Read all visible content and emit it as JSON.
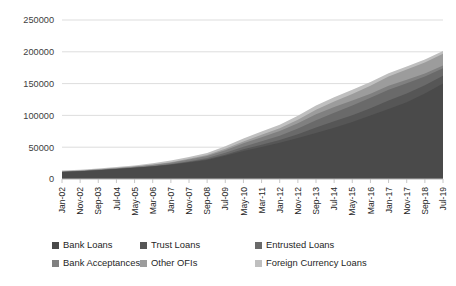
{
  "chart_data": {
    "type": "area",
    "stacked": true,
    "title": "",
    "subtitle": "",
    "xlabel": "",
    "ylabel": "",
    "ylim": [
      0,
      250000
    ],
    "yticks": [
      0,
      50000,
      100000,
      150000,
      200000,
      250000
    ],
    "ytick_labels": [
      "0",
      "50000",
      "100000",
      "150000",
      "200000",
      "250000"
    ],
    "grid": true,
    "grid_axis": "y",
    "legend_position": "bottom",
    "legend_columns": 3,
    "x": [
      "Jan-02",
      "Nov-02",
      "Sep-03",
      "Jul-04",
      "May-05",
      "Mar-06",
      "Jan-07",
      "Nov-07",
      "Sep-08",
      "Jul-09",
      "May-10",
      "Mar-11",
      "Jan-12",
      "Nov-12",
      "Sep-13",
      "Jul-14",
      "May-15",
      "Mar-16",
      "Jan-17",
      "Nov-17",
      "Sep-18",
      "Jul-19"
    ],
    "xtick_labels": [
      "Jan-02",
      "Nov-02",
      "Sep-03",
      "Jul-04",
      "May-05",
      "Mar-06",
      "Jan-07",
      "Nov-07",
      "Sep-08",
      "Jul-09",
      "May-10",
      "Mar-11",
      "Jan-12",
      "Nov-12",
      "Sep-13",
      "Jul-14",
      "May-15",
      "Mar-16",
      "Jan-17",
      "Nov-17",
      "Sep-18",
      "Jul-19"
    ],
    "series": [
      {
        "name": "Bank Loans",
        "color": "#4a4a4a",
        "values": [
          11000,
          12200,
          13800,
          15600,
          17500,
          19800,
          22500,
          26000,
          30000,
          36500,
          44000,
          50500,
          57000,
          64500,
          72500,
          80500,
          89500,
          100000,
          110000,
          120500,
          134500,
          150000
        ]
      },
      {
        "name": "Trust Loans",
        "color": "#565656",
        "values": [
          0,
          0,
          0,
          0,
          0,
          100,
          300,
          700,
          1100,
          1800,
          2600,
          3400,
          4200,
          6000,
          8400,
          10200,
          10800,
          11200,
          13500,
          14000,
          13000,
          12200
        ]
      },
      {
        "name": "Entrusted Loans",
        "color": "#6a6a6a",
        "values": [
          0,
          0,
          0,
          0,
          100,
          300,
          600,
          1100,
          1800,
          2800,
          4100,
          5400,
          6900,
          8800,
          11400,
          13500,
          15200,
          16500,
          17000,
          16000,
          13500,
          12000
        ]
      },
      {
        "name": "Bank Acceptances",
        "color": "#808080",
        "values": [
          800,
          900,
          1100,
          1300,
          1500,
          1800,
          2200,
          2800,
          3200,
          4300,
          5500,
          6500,
          7200,
          8400,
          9500,
          9200,
          7800,
          6500,
          6000,
          5500,
          4800,
          4200
        ]
      },
      {
        "name": "Other OFIs",
        "color": "#9c9c9c",
        "values": [
          200,
          250,
          300,
          400,
          500,
          700,
          900,
          1200,
          1500,
          2000,
          2800,
          3600,
          4400,
          5600,
          7000,
          8500,
          10500,
          12500,
          14500,
          16000,
          17500,
          18500
        ]
      },
      {
        "name": "Foreign Currency Loans",
        "color": "#bfbfbf",
        "values": [
          1200,
          1300,
          1400,
          1600,
          1800,
          2100,
          2400,
          2900,
          3300,
          4000,
          4700,
          5300,
          5700,
          6200,
          6600,
          6800,
          6500,
          5800,
          5300,
          5000,
          4700,
          4400
        ]
      }
    ]
  },
  "legend": {
    "items": [
      {
        "label": "Bank Loans",
        "color": "#4a4a4a"
      },
      {
        "label": "Trust Loans",
        "color": "#565656"
      },
      {
        "label": "Entrusted Loans",
        "color": "#6a6a6a"
      },
      {
        "label": "Bank Acceptances",
        "color": "#808080"
      },
      {
        "label": "Other OFIs",
        "color": "#9c9c9c"
      },
      {
        "label": "Foreign Currency Loans",
        "color": "#bfbfbf"
      }
    ]
  },
  "style": {
    "background": "#ffffff",
    "gridline_color": "#d9d9d9",
    "axis_color": "#bfbfbf",
    "text_color": "#262626"
  }
}
